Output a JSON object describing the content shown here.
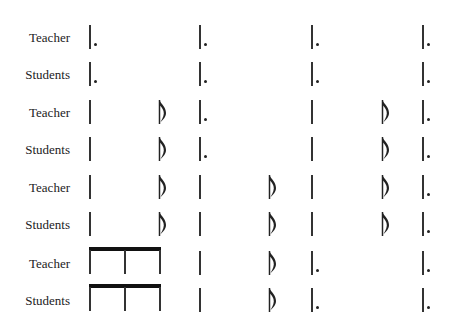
{
  "rows": [
    {
      "label": "Teacher",
      "pattern": "A"
    },
    {
      "label": "Students",
      "pattern": "A"
    },
    {
      "label": "Teacher",
      "pattern": "B"
    },
    {
      "label": "Students",
      "pattern": "B"
    },
    {
      "label": "Teacher",
      "pattern": "C"
    },
    {
      "label": "Students",
      "pattern": "C"
    },
    {
      "label": "Teacher",
      "pattern": "D"
    },
    {
      "label": "Students",
      "pattern": "D"
    }
  ],
  "patterns": {
    "A": [
      "bar-dot",
      "",
      "bar-dot",
      "",
      "bar-dot",
      "",
      "bar-dot"
    ],
    "B": [
      "bar",
      "eighth",
      "bar-dot",
      "",
      "bar",
      "eighth",
      "bar-dot"
    ],
    "C": [
      "bar",
      "eighth",
      "bar",
      "eighth",
      "bar",
      "eighth",
      "bar-dot"
    ],
    "D": [
      "beamed-triplet",
      "",
      "bar",
      "eighth",
      "bar-dot",
      "",
      "bar-dot"
    ]
  },
  "colors": {
    "ink": "#222222",
    "background": "#ffffff"
  }
}
